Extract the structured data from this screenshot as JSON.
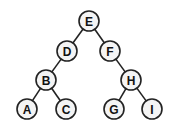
{
  "diagram": {
    "type": "binary-tree",
    "nodes": [
      {
        "id": "E",
        "label": "E",
        "x": 89,
        "y": 21
      },
      {
        "id": "D",
        "label": "D",
        "x": 67,
        "y": 51
      },
      {
        "id": "F",
        "label": "F",
        "x": 110,
        "y": 51
      },
      {
        "id": "B",
        "label": "B",
        "x": 46,
        "y": 80
      },
      {
        "id": "H",
        "label": "H",
        "x": 131,
        "y": 80
      },
      {
        "id": "A",
        "label": "A",
        "x": 27,
        "y": 109
      },
      {
        "id": "C",
        "label": "C",
        "x": 66,
        "y": 109
      },
      {
        "id": "G",
        "label": "G",
        "x": 114,
        "y": 109
      },
      {
        "id": "I",
        "label": "I",
        "x": 152,
        "y": 109
      }
    ],
    "edges": [
      [
        "E",
        "D"
      ],
      [
        "E",
        "F"
      ],
      [
        "D",
        "B"
      ],
      [
        "F",
        "H"
      ],
      [
        "B",
        "A"
      ],
      [
        "B",
        "C"
      ],
      [
        "H",
        "G"
      ],
      [
        "H",
        "I"
      ]
    ],
    "node_radius": 10
  }
}
